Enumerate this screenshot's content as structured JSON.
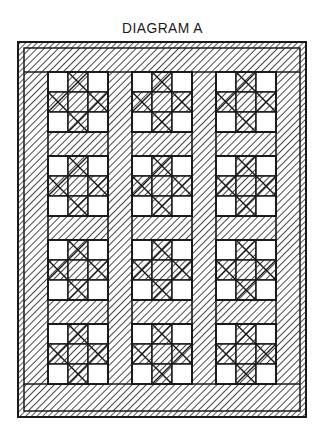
{
  "title": "DIAGRAM A",
  "diagram": {
    "type": "quilt-layout",
    "colors": {
      "ink": "#1a1a1a",
      "background": "#ffffff"
    },
    "outer_frame": {
      "x": 18,
      "y": 42,
      "width": 288,
      "height": 375,
      "border_width": 6
    },
    "sashing_width": 24,
    "block_size": 60,
    "grid": {
      "columns": 3,
      "rows": 4
    },
    "column_x": [
      48,
      132,
      216
    ],
    "row_y": [
      72,
      156,
      240,
      324
    ],
    "block": {
      "name": "ohio-star",
      "cells": [
        [
          "plain",
          "hatched-x",
          "plain"
        ],
        [
          "hatched-x",
          "hatched",
          "hatched-x"
        ],
        [
          "plain",
          "hatched-x",
          "plain"
        ]
      ]
    }
  }
}
